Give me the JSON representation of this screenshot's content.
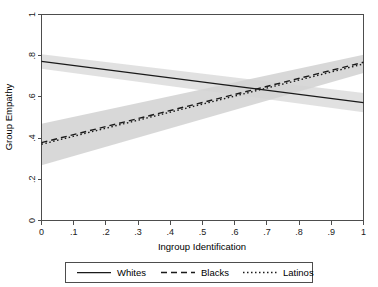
{
  "chart_data": {
    "type": "line",
    "title": "",
    "xlabel": "Ingroup Identification",
    "ylabel": "Group Empathy",
    "xlim": [
      0,
      1
    ],
    "ylim": [
      0,
      1
    ],
    "grid": false,
    "legend_position": "bottom",
    "x_ticks": [
      "0",
      ".1",
      ".2",
      ".3",
      ".4",
      ".5",
      ".6",
      ".7",
      ".8",
      ".9",
      "1"
    ],
    "x_tick_values": [
      0,
      0.1,
      0.2,
      0.3,
      0.4,
      0.5,
      0.6,
      0.7,
      0.8,
      0.9,
      1
    ],
    "y_ticks": [
      "0",
      ".2",
      ".4",
      ".6",
      ".8",
      "1"
    ],
    "y_tick_values": [
      0,
      0.2,
      0.4,
      0.6,
      0.8,
      1
    ],
    "x": [
      0,
      1
    ],
    "series": [
      {
        "name": "Whites",
        "style": "solid",
        "values": [
          0.772,
          0.572
        ],
        "ci_lower": [
          0.737,
          0.525
        ],
        "ci_upper": [
          0.807,
          0.619
        ]
      },
      {
        "name": "Blacks",
        "style": "dashed",
        "values": [
          0.378,
          0.768
        ],
        "ci_lower": [
          0.268,
          0.716
        ],
        "ci_upper": [
          0.47,
          0.805
        ]
      },
      {
        "name": "Latinos",
        "style": "dotted",
        "values": [
          0.37,
          0.76
        ],
        "ci_lower": [
          0.268,
          0.716
        ],
        "ci_upper": [
          0.47,
          0.805
        ]
      }
    ],
    "annotations": [
      {
        "text": "lines cross near x = .67, y = .65"
      }
    ],
    "colors": {
      "line": "#1a1a1a",
      "ci_band": "#d9d9d9",
      "axis": "#4d4d4d",
      "background": "#ffffff"
    }
  },
  "legend": {
    "items": [
      {
        "label": "Whites",
        "style": "solid"
      },
      {
        "label": "Blacks",
        "style": "dashed"
      },
      {
        "label": "Latinos",
        "style": "dotted"
      }
    ]
  }
}
